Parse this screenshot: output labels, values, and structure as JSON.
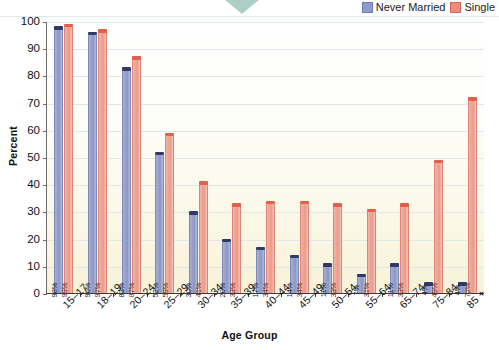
{
  "legend": {
    "series": [
      {
        "label": "Never Married",
        "color": "#8f9bc8",
        "swatch": "blue"
      },
      {
        "label": "Single",
        "color": "#ec8d7c",
        "swatch": "red"
      }
    ]
  },
  "axes": {
    "ylabel": "Percent",
    "xlabel": "Age Group",
    "yticks": [
      "0",
      "10",
      "20",
      "30",
      "40",
      "50",
      "60",
      "70",
      "80",
      "90",
      "100"
    ]
  },
  "chart_data": {
    "type": "bar",
    "title": "",
    "xlabel": "Age Group",
    "ylabel": "Percent",
    "ylim": [
      0,
      100
    ],
    "grid": true,
    "legend_position": "top-right",
    "categories": [
      "15–17",
      "18–19",
      "20–24",
      "25–29",
      "30–34",
      "35–39",
      "40–44",
      "45–49",
      "50–54",
      "55–64",
      "65–74",
      "75–84",
      "85 +"
    ],
    "series": [
      {
        "name": "Never Married",
        "color": "#8f9bc8",
        "values": [
          98,
          96,
          83,
          52,
          30,
          20,
          17,
          14,
          11,
          7,
          11,
          4,
          4
        ],
        "labels": [
          "98%",
          "96%",
          "83%",
          "52%",
          "30%",
          "20%",
          "17%",
          "14%",
          "11%",
          "7%",
          "11%",
          "4%",
          "4%"
        ]
      },
      {
        "name": "Single",
        "color": "#ec8d7c",
        "values": [
          99,
          97,
          87,
          59,
          41,
          33,
          34,
          34,
          33,
          31,
          33,
          49,
          72
        ],
        "labels": [
          "99%",
          "97%",
          "87%",
          "59%",
          "41%",
          "33%",
          "34%",
          "34%",
          "33%",
          "31%",
          "33%",
          "49%",
          "72%"
        ]
      }
    ]
  }
}
